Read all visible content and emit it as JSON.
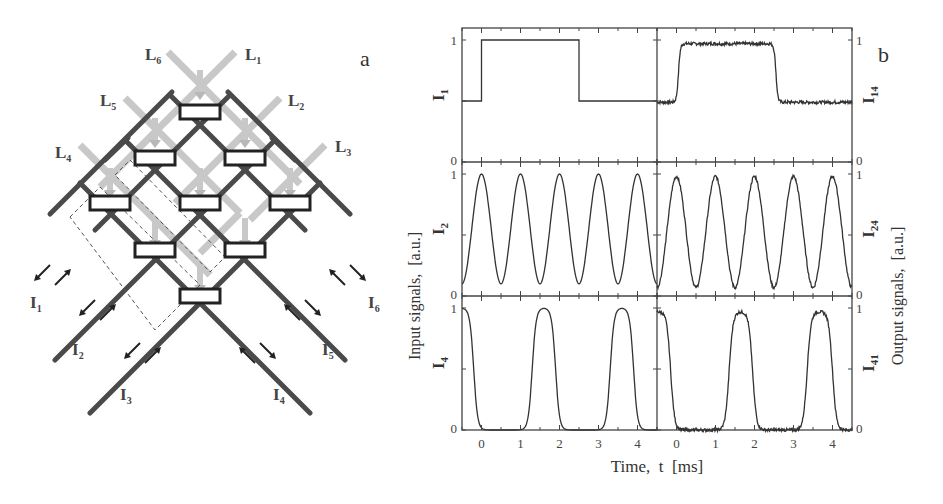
{
  "figure": {
    "panel_a_label": "a",
    "panel_b_label": "b"
  },
  "diagram": {
    "light_labels": [
      {
        "id": "L1",
        "main": "L",
        "sub": "1"
      },
      {
        "id": "L2",
        "main": "L",
        "sub": "2"
      },
      {
        "id": "L3",
        "main": "L",
        "sub": "3"
      },
      {
        "id": "L4",
        "main": "L",
        "sub": "4"
      },
      {
        "id": "L5",
        "main": "L",
        "sub": "5"
      },
      {
        "id": "L6",
        "main": "L",
        "sub": "6"
      }
    ],
    "port_labels": [
      {
        "id": "I1",
        "main": "I",
        "sub": "1"
      },
      {
        "id": "I2",
        "main": "I",
        "sub": "2"
      },
      {
        "id": "I3",
        "main": "I",
        "sub": "3"
      },
      {
        "id": "I4",
        "main": "I",
        "sub": "4"
      },
      {
        "id": "I5",
        "main": "I",
        "sub": "5"
      },
      {
        "id": "I6",
        "main": "I",
        "sub": "6"
      }
    ],
    "colors": {
      "waveguide": "#4a4a4a",
      "light": "#c8c8c8",
      "box_border": "#222222"
    }
  },
  "axes": {
    "xlabel": "Time,  t  [ms]",
    "ylabel_left": "Input signals,  [a.u.]",
    "ylabel_right": "Output signals,  [a.u.]",
    "x_ticks": [
      "0",
      "1",
      "2",
      "3",
      "4"
    ],
    "y_tick_top": "1",
    "y_tick_bottom": "0"
  },
  "chart_data": {
    "type": "line",
    "title": "",
    "xlabel": "Time, t [ms]",
    "ylabel_left": "Input signals, [a.u.]",
    "ylabel_right": "Output signals, [a.u.]",
    "xlim": [
      -0.5,
      4.5
    ],
    "ylim": [
      0,
      1
    ],
    "grid": false,
    "layout": "3 rows x 2 columns (left: inputs, right: outputs)",
    "panels": [
      {
        "row": 0,
        "col": 0,
        "label": "I1",
        "label_main": "I",
        "label_sub": "1",
        "kind": "step",
        "x": [
          -0.5,
          0.0,
          0.0,
          2.5,
          2.5,
          4.5
        ],
        "y": [
          0.5,
          0.5,
          1.0,
          1.0,
          0.5,
          0.5
        ]
      },
      {
        "row": 0,
        "col": 1,
        "label": "I14",
        "label_main": "I",
        "label_sub": "14",
        "kind": "step-noisy",
        "x": [
          -0.5,
          0.0,
          0.12,
          2.5,
          2.62,
          4.5
        ],
        "y": [
          0.49,
          0.49,
          0.96,
          0.98,
          0.53,
          0.49
        ]
      },
      {
        "row": 1,
        "col": 0,
        "label": "I2",
        "label_main": "I",
        "label_sub": "2",
        "kind": "sine",
        "period_ms": 1.0,
        "peaks_at_ms": [
          0.0,
          1.0,
          2.0,
          3.0,
          4.0
        ],
        "min": 0.1,
        "max": 1.0
      },
      {
        "row": 1,
        "col": 1,
        "label": "I24",
        "label_main": "I",
        "label_sub": "24",
        "kind": "sine-noisy",
        "period_ms": 1.0,
        "peaks_at_ms": [
          0.0,
          1.0,
          2.0,
          3.0,
          4.0
        ],
        "min": 0.07,
        "max": 0.98
      },
      {
        "row": 2,
        "col": 0,
        "label": "I4",
        "label_main": "I",
        "label_sub": "4",
        "kind": "square-smooth",
        "high_intervals_ms": [
          [
            -0.5,
            -0.2
          ],
          [
            1.3,
            1.9
          ],
          [
            3.3,
            3.9
          ]
        ],
        "low": 0.0,
        "high": 1.0
      },
      {
        "row": 2,
        "col": 1,
        "label": "I41",
        "label_main": "I",
        "label_sub": "41",
        "kind": "square-noisy",
        "high_intervals_ms": [
          [
            -0.5,
            -0.15
          ],
          [
            1.35,
            1.95
          ],
          [
            3.35,
            4.0
          ]
        ],
        "low": 0.0,
        "high": 0.97
      }
    ],
    "x_ticks": [
      0,
      1,
      2,
      3,
      4
    ],
    "y_ticks": [
      0,
      1
    ]
  }
}
